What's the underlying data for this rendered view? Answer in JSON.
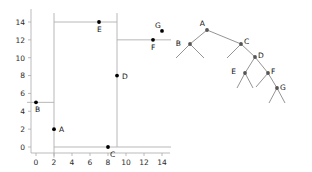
{
  "figure": {
    "background": "#ffffff",
    "panels": [
      "kd-partition-plot",
      "kd-tree-diagram"
    ]
  },
  "chart_data": {
    "type": "scatter",
    "title": "",
    "xlabel": "",
    "ylabel": "",
    "xlim": [
      -1,
      15
    ],
    "ylim": [
      -1.2,
      15
    ],
    "xticks": [
      0,
      2,
      4,
      6,
      8,
      10,
      12,
      14
    ],
    "yticks": [
      0,
      2,
      4,
      6,
      8,
      10,
      12,
      14
    ],
    "grid": false,
    "legend": "none",
    "points": [
      {
        "label": "A",
        "x": 2,
        "y": 2,
        "label_dx": 5,
        "label_dy": 3
      },
      {
        "label": "B",
        "x": 0,
        "y": 5,
        "label_dx": -1,
        "label_dy": 10
      },
      {
        "label": "C",
        "x": 8,
        "y": 0,
        "label_dx": 2,
        "label_dy": 10
      },
      {
        "label": "D",
        "x": 9,
        "y": 8,
        "label_dx": 5,
        "label_dy": 3
      },
      {
        "label": "E",
        "x": 7,
        "y": 14,
        "label_dx": -2,
        "label_dy": 10
      },
      {
        "label": "F",
        "x": 13,
        "y": 12,
        "label_dx": -2,
        "label_dy": 10
      },
      {
        "label": "G",
        "x": 14,
        "y": 13,
        "label_dx": -7,
        "label_dy": -3
      }
    ],
    "partitions": [
      {
        "name": "split-A-vertical",
        "orient": "v",
        "at": 2,
        "from": -1.2,
        "to": 15
      },
      {
        "name": "split-B-horizontal",
        "orient": "h",
        "at": 5,
        "from": -1,
        "to": 2
      },
      {
        "name": "split-C-horizontal",
        "orient": "h",
        "at": 0,
        "from": 2,
        "to": 15
      },
      {
        "name": "split-D-vertical",
        "orient": "v",
        "at": 9,
        "from": 0,
        "to": 15
      },
      {
        "name": "split-E-horizontal",
        "orient": "h",
        "at": 14,
        "from": 2,
        "to": 9
      },
      {
        "name": "split-F-horizontal",
        "orient": "h",
        "at": 12,
        "from": 9,
        "to": 15
      }
    ]
  },
  "tree_data": {
    "type": "binary-tree",
    "nodes": [
      {
        "id": "A",
        "label": "A",
        "x": 207,
        "y": 30,
        "label_dx": -2,
        "label_dy": -4
      },
      {
        "id": "B",
        "label": "B",
        "x": 190,
        "y": 44,
        "label_dx": -9,
        "label_dy": 2
      },
      {
        "id": "C",
        "label": "C",
        "x": 241,
        "y": 44,
        "label_dx": 3,
        "label_dy": 0
      },
      {
        "id": "D",
        "label": "D",
        "x": 255,
        "y": 57,
        "label_dx": 3,
        "label_dy": 1
      },
      {
        "id": "E",
        "label": "E",
        "x": 245,
        "y": 73,
        "label_dx": -9,
        "label_dy": 1
      },
      {
        "id": "F",
        "label": "F",
        "x": 268,
        "y": 73,
        "label_dx": 3,
        "label_dy": 1
      },
      {
        "id": "G",
        "label": "G",
        "x": 277,
        "y": 88,
        "label_dx": 3,
        "label_dy": 2
      }
    ],
    "edges": [
      {
        "from": "A",
        "to": "B"
      },
      {
        "from": "A",
        "to": "C"
      },
      {
        "from": "C",
        "to": "D"
      },
      {
        "from": "D",
        "to": "E"
      },
      {
        "from": "D",
        "to": "F"
      },
      {
        "from": "F",
        "to": "G"
      }
    ],
    "leaf_stubs": [
      {
        "from": "B",
        "dx": -14,
        "dy": 14
      },
      {
        "from": "B",
        "dx": 14,
        "dy": 14
      },
      {
        "from": "C",
        "dx": -14,
        "dy": 14
      },
      {
        "from": "E",
        "dx": -8,
        "dy": 15
      },
      {
        "from": "E",
        "dx": 8,
        "dy": 15
      },
      {
        "from": "F",
        "dx": -12,
        "dy": 14
      },
      {
        "from": "G",
        "dx": -8,
        "dy": 15
      },
      {
        "from": "G",
        "dx": 8,
        "dy": 15
      }
    ]
  },
  "style": {
    "point_color": "#000000",
    "line_color": "#b0b0b0",
    "edge_color": "#888888",
    "axis_color": "#aaaaaa",
    "text_color": "#111111"
  }
}
